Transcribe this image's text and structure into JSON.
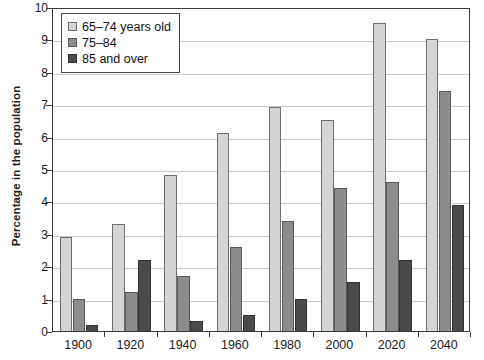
{
  "chart_data": {
    "type": "bar",
    "title": "",
    "xlabel": "",
    "ylabel": "Percentage in the population",
    "categories": [
      "1900",
      "1920",
      "1940",
      "1960",
      "1980",
      "2000",
      "2020",
      "2040"
    ],
    "series": [
      {
        "name": "65–74 years old",
        "color": "#d4d4d4",
        "values": [
          2.9,
          3.3,
          4.8,
          6.1,
          6.9,
          6.5,
          9.5,
          9.0
        ]
      },
      {
        "name": "75–84",
        "color": "#8c8c8c",
        "values": [
          1.0,
          1.2,
          1.7,
          2.6,
          3.4,
          4.4,
          4.6,
          7.4
        ]
      },
      {
        "name": "85 and over",
        "color": "#4a4a4a",
        "values": [
          0.2,
          2.2,
          0.3,
          0.5,
          1.0,
          1.5,
          2.2,
          3.9
        ]
      }
    ],
    "ylim": [
      0,
      10
    ],
    "ytick_values": [
      "0",
      "1",
      "2",
      "3",
      "4",
      "5",
      "6",
      "7",
      "8",
      "9",
      "10"
    ],
    "ytick_step": 1,
    "grid": true,
    "legend_position": "top-left"
  }
}
